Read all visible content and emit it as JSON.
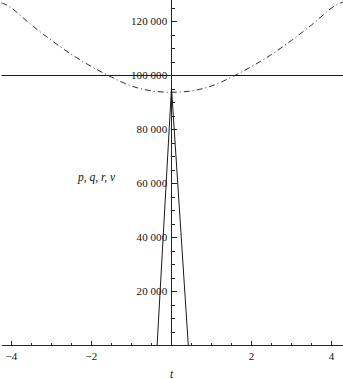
{
  "chart_data": {
    "type": "line",
    "title": "",
    "xlabel": "t",
    "ylabel": "p, q, r, v",
    "xlim": [
      -4.25,
      4.3
    ],
    "ylim": [
      0,
      128000
    ],
    "grid": false,
    "legend": null,
    "x_ticks": [
      {
        "value": -4,
        "label": "−4"
      },
      {
        "value": -2,
        "label": "−2"
      },
      {
        "value": 2,
        "label": "2"
      },
      {
        "value": 4,
        "label": "4"
      }
    ],
    "x_minor_tick_step": 0.5,
    "y_ticks": [
      {
        "value": 20000,
        "label": "20 000"
      },
      {
        "value": 40000,
        "label": "40 000"
      },
      {
        "value": 60000,
        "label": "60 000"
      },
      {
        "value": 80000,
        "label": "80 000"
      },
      {
        "value": 100000,
        "label": "100 000"
      },
      {
        "value": 120000,
        "label": "120 000"
      }
    ],
    "y_minor_tick_step": 5000,
    "series": [
      {
        "name": "constant",
        "style": "solid",
        "color": "#1a1a1a",
        "x": [
          -4.25,
          4.3
        ],
        "values": [
          100000,
          100000
        ]
      },
      {
        "name": "parabola",
        "style": "dashdot",
        "color": "#2b2b2b",
        "x": [
          -4.25,
          -4.0,
          -3.5,
          -3.0,
          -2.5,
          -2.0,
          -1.5,
          -1.0,
          -0.5,
          0.0,
          0.5,
          1.0,
          1.5,
          2.0,
          2.5,
          3.0,
          3.5,
          4.0,
          4.3
        ],
        "values": [
          126900,
          125000,
          118700,
          113000,
          107800,
          103300,
          99400,
          96100,
          94300,
          93800,
          94300,
          96100,
          99400,
          103300,
          107800,
          113000,
          118700,
          125000,
          127300
        ]
      },
      {
        "name": "spike",
        "style": "solid",
        "color": "#1a1a1a",
        "x": [
          -0.36,
          0.0,
          0.42
        ],
        "values": [
          0,
          95500,
          0
        ]
      }
    ],
    "annotations": []
  }
}
